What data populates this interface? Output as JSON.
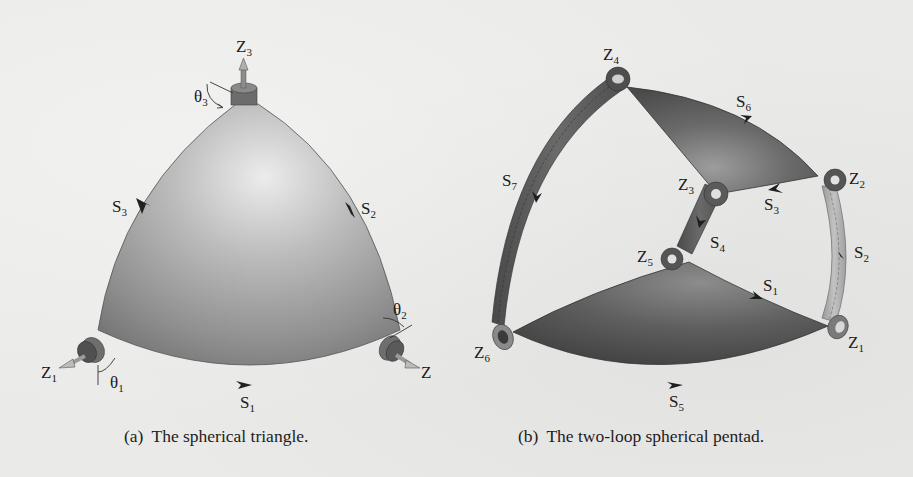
{
  "figure": {
    "panel_a": {
      "caption_tag": "(a)",
      "caption_text": "The spherical triangle.",
      "labels": {
        "z3": {
          "main": "Z",
          "sub": "3"
        },
        "z1": {
          "main": "Z",
          "sub": "1"
        },
        "z2": {
          "main": "Z",
          "sub": ""
        },
        "theta1": {
          "main": "θ",
          "sub": "1"
        },
        "theta2": {
          "main": "θ",
          "sub": "2"
        },
        "theta3": {
          "main": "θ",
          "sub": "3"
        },
        "s1": {
          "main": "S",
          "sub": "1"
        },
        "s2": {
          "main": "S",
          "sub": "2"
        },
        "s3": {
          "main": "S",
          "sub": "3"
        }
      }
    },
    "panel_b": {
      "caption_tag": "(b)",
      "caption_text": "The two-loop spherical pentad.",
      "labels": {
        "z1": {
          "main": "Z",
          "sub": "1"
        },
        "z2": {
          "main": "Z",
          "sub": "2"
        },
        "z3": {
          "main": "Z",
          "sub": "3"
        },
        "z4": {
          "main": "Z",
          "sub": "4"
        },
        "z5": {
          "main": "Z",
          "sub": "5"
        },
        "z6": {
          "main": "Z",
          "sub": "6"
        },
        "s1": {
          "main": "S",
          "sub": "1"
        },
        "s2": {
          "main": "S",
          "sub": "2"
        },
        "s3": {
          "main": "S",
          "sub": "3"
        },
        "s4": {
          "main": "S",
          "sub": "4"
        },
        "s5": {
          "main": "S",
          "sub": "5"
        },
        "s6": {
          "main": "S",
          "sub": "6"
        },
        "s7": {
          "main": "S",
          "sub": "7"
        }
      }
    }
  },
  "colors": {
    "paper": "#eaeae8",
    "surface_light": "#d8d8d8",
    "surface_mid": "#9a9a9a",
    "surface_dark": "#5a5a5a",
    "link_dark": "#555555",
    "link_light": "#a8a8a8",
    "ink": "#1a1a1a"
  }
}
